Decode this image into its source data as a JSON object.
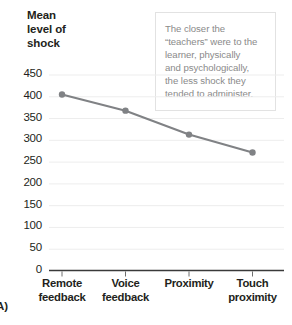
{
  "chart_data": {
    "type": "line",
    "title": "",
    "ylabel": "Mean level of shock",
    "xlabel": "",
    "categories": [
      "Remote feedback",
      "Voice feedback",
      "Proximity",
      "Touch proximity"
    ],
    "values": [
      404,
      367,
      312,
      271
    ],
    "ylim": [
      0,
      450
    ],
    "yticks": [
      0,
      50,
      100,
      150,
      200,
      250,
      300,
      350,
      400,
      450
    ],
    "ytick_labels": [
      "0",
      "50",
      "100",
      "150",
      "200",
      "250",
      "300",
      "350",
      "400",
      "450"
    ],
    "grid": true,
    "legend": false,
    "series_color": "#808285",
    "marker": "circle",
    "annotations": [
      "The closer the “teachers” were to the learner, physically and psychologically, the less shock they tended to administer."
    ]
  },
  "axis_title": {
    "line1": "Mean",
    "line2": "level of",
    "line3": "shock"
  },
  "annotation": {
    "line1": "The closer the",
    "line2": "“teachers” were to the",
    "line3": "learner, physically",
    "line4": "and psychologically,",
    "line5": "the less shock they",
    "line6": "tended to administer."
  },
  "x_labels": [
    {
      "line1": "Remote",
      "line2": "feedback"
    },
    {
      "line1": "Voice",
      "line2": "feedback"
    },
    {
      "line1": "Proximity",
      "line2": ""
    },
    {
      "line1": "Touch",
      "line2": "proximity"
    }
  ],
  "panel": {
    "label": "A)"
  },
  "colors": {
    "series": "#808285",
    "text": "#231f20",
    "annotation_text": "#8a8a8a",
    "gridline": "#ededed",
    "axis": "#3a3a3a",
    "box_border": "#e2e2e2"
  }
}
